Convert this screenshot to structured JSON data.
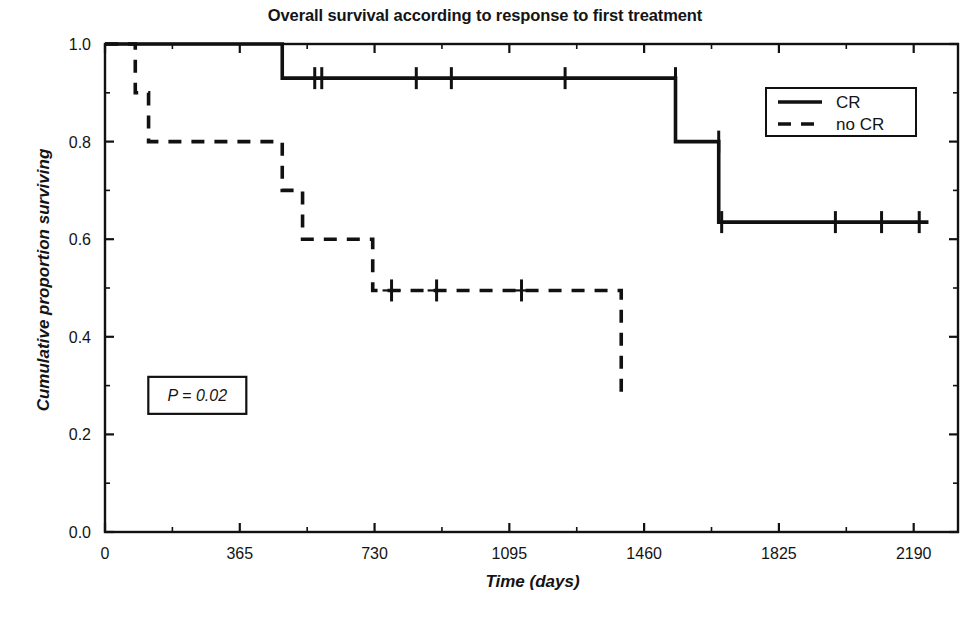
{
  "chart_data": {
    "type": "line",
    "subtype": "kaplan-meier-survival",
    "title": "Overall survival according to response to first treatment",
    "xlabel": "Time (days)",
    "ylabel": "Cumulative proportion surviving",
    "xlim": [
      0,
      2310
    ],
    "ylim": [
      0.0,
      1.0
    ],
    "grid": false,
    "xticks": [
      0,
      365,
      730,
      1095,
      1460,
      1825,
      2190
    ],
    "xtick_labels": [
      "0",
      "365",
      "730",
      "1095",
      "1460",
      "1825",
      "2190"
    ],
    "x_minor_tick_interval": 182.5,
    "yticks": [
      0.0,
      0.2,
      0.4,
      0.6,
      0.8,
      1.0
    ],
    "ytick_labels": [
      "0.0",
      "0.2",
      "0.4",
      "0.6",
      "0.8",
      "1.0"
    ],
    "y_minor_tick_interval": 0.1,
    "annotations": [
      {
        "name": "p-value",
        "text": "P = 0.02",
        "x": 250,
        "y": 0.28,
        "boxed": true
      }
    ],
    "legend": {
      "position": "upper-right",
      "boxed": true,
      "entries": [
        {
          "label": "CR",
          "style": "solid"
        },
        {
          "label": "no CR",
          "style": "dashed"
        }
      ]
    },
    "series": [
      {
        "name": "CR",
        "style": "solid",
        "color": "#111111",
        "steps": [
          {
            "t": 0,
            "s": 1.0
          },
          {
            "t": 480,
            "s": 1.0
          },
          {
            "t": 480,
            "s": 0.93
          },
          {
            "t": 1545,
            "s": 0.93
          },
          {
            "t": 1545,
            "s": 0.8
          },
          {
            "t": 1662,
            "s": 0.8
          },
          {
            "t": 1662,
            "s": 0.635
          },
          {
            "t": 2230,
            "s": 0.635
          }
        ],
        "censored": [
          {
            "t": 568,
            "s": 0.93
          },
          {
            "t": 587,
            "s": 0.93
          },
          {
            "t": 843,
            "s": 0.93
          },
          {
            "t": 938,
            "s": 0.93
          },
          {
            "t": 1246,
            "s": 0.93
          },
          {
            "t": 1545,
            "s": 0.93
          },
          {
            "t": 1662,
            "s": 0.8
          },
          {
            "t": 1670,
            "s": 0.635
          },
          {
            "t": 1978,
            "s": 0.635
          },
          {
            "t": 2103,
            "s": 0.635
          },
          {
            "t": 2205,
            "s": 0.635
          }
        ]
      },
      {
        "name": "no CR",
        "style": "dashed",
        "color": "#111111",
        "steps": [
          {
            "t": 0,
            "s": 1.0
          },
          {
            "t": 82,
            "s": 1.0
          },
          {
            "t": 82,
            "s": 0.9
          },
          {
            "t": 118,
            "s": 0.9
          },
          {
            "t": 118,
            "s": 0.8
          },
          {
            "t": 480,
            "s": 0.8
          },
          {
            "t": 480,
            "s": 0.7
          },
          {
            "t": 535,
            "s": 0.7
          },
          {
            "t": 535,
            "s": 0.6
          },
          {
            "t": 725,
            "s": 0.6
          },
          {
            "t": 725,
            "s": 0.495
          },
          {
            "t": 1398,
            "s": 0.495
          },
          {
            "t": 1398,
            "s": 0.275
          }
        ],
        "censored": [
          {
            "t": 776,
            "s": 0.495
          },
          {
            "t": 898,
            "s": 0.495
          },
          {
            "t": 1128,
            "s": 0.495
          }
        ]
      }
    ]
  }
}
